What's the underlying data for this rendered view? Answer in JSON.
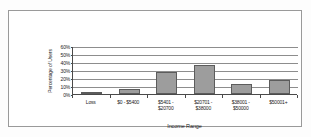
{
  "chart_data": {
    "type": "bar",
    "title": "",
    "xlabel": "Income Range",
    "ylabel": "Percentage of Users",
    "categories": [
      "Loss",
      "$0 - $5400",
      "$5401 - $20700",
      "$20701 - $38000",
      "$38001 - $50000",
      "$50001+"
    ],
    "category_lines": [
      [
        "Loss",
        ""
      ],
      [
        "$0 - $5400",
        ""
      ],
      [
        "$5401 -",
        "$20700"
      ],
      [
        "$20701 -",
        "$38000"
      ],
      [
        "$38001 -",
        "$50000"
      ],
      [
        "$50001+",
        ""
      ]
    ],
    "values": [
      1,
      6,
      27,
      36,
      13,
      17
    ],
    "value_labels": [
      "1%",
      "6%",
      "27%",
      "36%",
      "13%",
      "17%"
    ],
    "ylim": [
      0,
      60
    ],
    "ytick_values": [
      60,
      50,
      40,
      30,
      20,
      10,
      0
    ],
    "ytick_labels": [
      "60%",
      "50%",
      "40%",
      "30%",
      "20%",
      "10%",
      "0%"
    ],
    "grid": true,
    "legend": "none",
    "legend_position": "none",
    "colors": {
      "bar_fill": "#9d9d9d",
      "bar_border": "#5c5c5c",
      "gridline": "#8d8d8d",
      "axis": "#4a4a4a",
      "frame": "#9a9a9a",
      "text": "#1d1d1d",
      "plot_background": "#ffffff"
    }
  }
}
